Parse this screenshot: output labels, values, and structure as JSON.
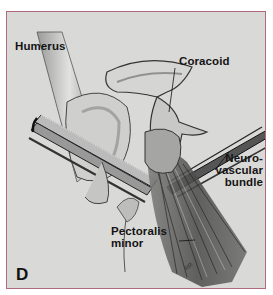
{
  "figure": {
    "panel_letter": "D",
    "labels": {
      "humerus": "Humerus",
      "coracoid": "Coracoid",
      "neurovascular_line1": "Neuro-",
      "neurovascular_line2": "vascular",
      "neurovascular_line3": "bundle",
      "pectoralis_line1": "Pectoralis",
      "pectoralis_line2": "minor"
    },
    "signature": "RR",
    "colors": {
      "frame_border": "#b06a7e",
      "background": "#d9d9d7",
      "ink": "#141414"
    }
  }
}
